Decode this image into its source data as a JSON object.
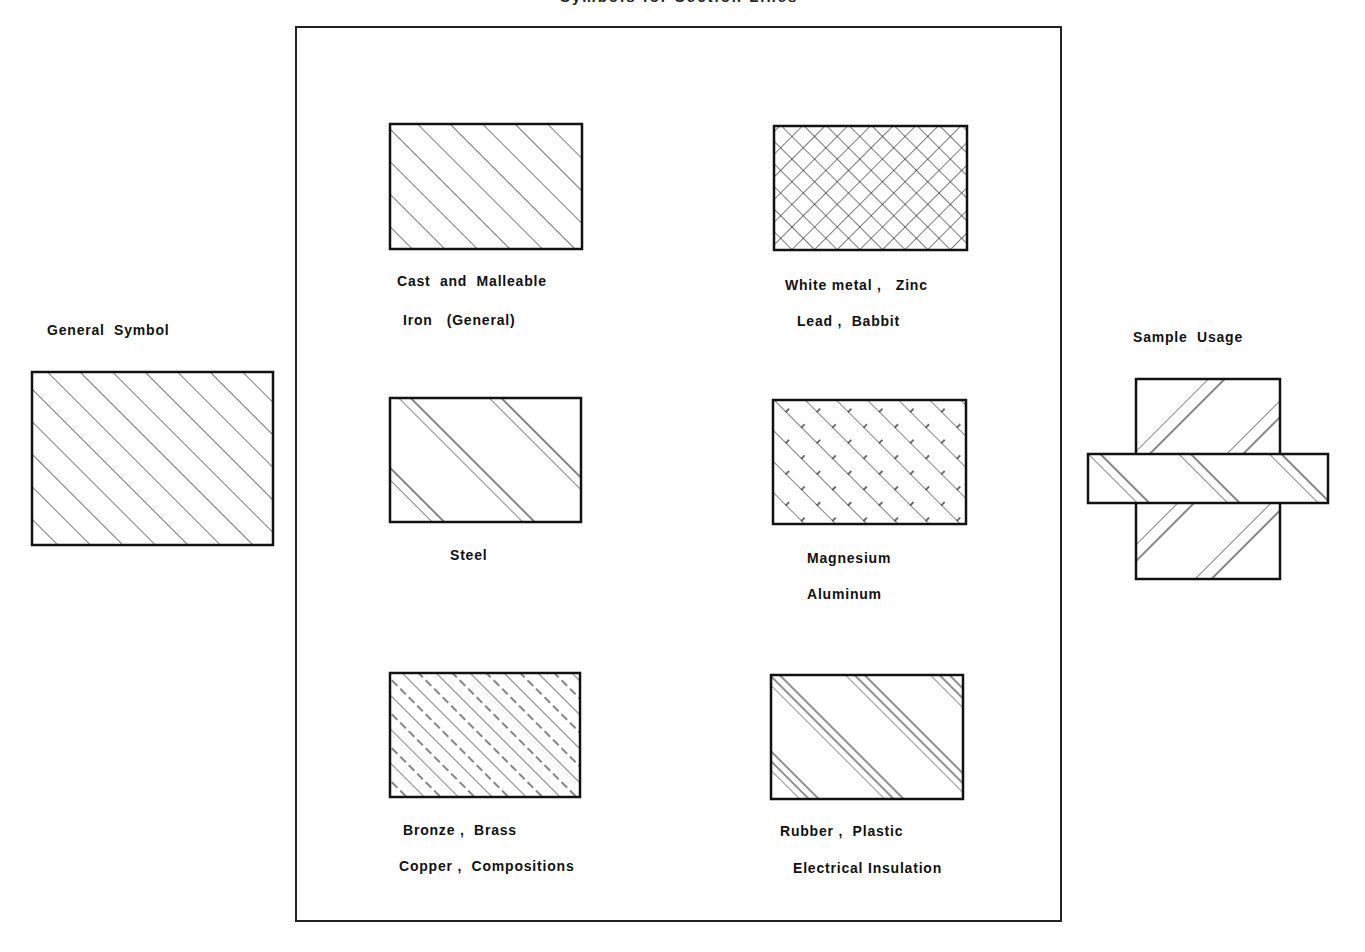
{
  "title": "Symbols for Section Lines",
  "general": {
    "label": "General  Symbol"
  },
  "sample": {
    "label": "Sample  Usage"
  },
  "materials": [
    {
      "id": "cast-iron",
      "line1": "Cast  and  Malleable",
      "line2": "Iron   (General)"
    },
    {
      "id": "white-metal",
      "line1": "White metal ,   Zinc",
      "line2": "Lead ,  Babbit"
    },
    {
      "id": "steel",
      "line1": "Steel",
      "line2": ""
    },
    {
      "id": "magnesium",
      "line1": "Magnesium",
      "line2": "Aluminum"
    },
    {
      "id": "bronze",
      "line1": "Bronze ,  Brass",
      "line2": "Copper ,  Compositions"
    },
    {
      "id": "rubber",
      "line1": "Rubber ,  Plastic",
      "line2": "Electrical Insulation"
    }
  ],
  "colors": {
    "ink": "#111111",
    "background": "#ffffff"
  }
}
